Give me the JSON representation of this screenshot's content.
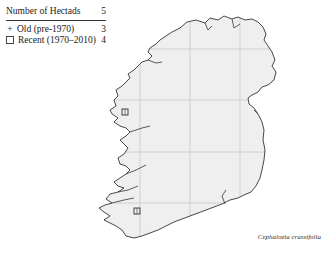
{
  "legend": {
    "title": "Number of Hectads",
    "total": "5",
    "rows": [
      {
        "symbol": "plus-icon",
        "label": "Old  (pre-1970)",
        "count": "3"
      },
      {
        "symbol": "square-icon",
        "label": "Recent  (1970–2010)",
        "count": "4"
      }
    ]
  },
  "map": {
    "region": "Ireland",
    "land_color": "#efefef",
    "grid_color": "#c8c8c8",
    "coast_color": "#333333",
    "grid_x": [
      140,
      190,
      240
    ],
    "grid_y": [
      49,
      100,
      152,
      203
    ],
    "records": [
      {
        "type": "recent",
        "x": 125,
        "y": 112
      },
      {
        "type": "recent",
        "x": 137,
        "y": 211
      }
    ]
  },
  "caption": "Cephalozia crassifolia"
}
